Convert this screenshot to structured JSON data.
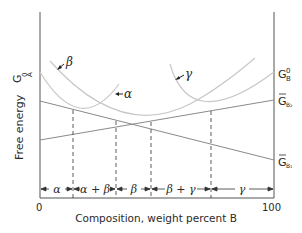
{
  "diagram": {
    "type": "free-energy-composition",
    "y_axis_label": "Free energy",
    "x_axis_label": "Composition, weight percent B",
    "x_ticks": [
      "0",
      "100"
    ],
    "left_labels": {
      "GA0": "G",
      "GA0_sub": "A",
      "GA0_sup": "0"
    },
    "right_labels": {
      "GB0": "G",
      "GB0_sub": "B",
      "GB0_sup": "0",
      "GB2": "G",
      "GB2_sub": "B₂",
      "GB1": "G",
      "GB1_sub": "B₁"
    },
    "curve_labels": {
      "beta": "β",
      "alpha": "α",
      "gamma": "γ"
    },
    "phase_regions": [
      "α",
      "α + β",
      "β",
      "β + γ",
      "γ"
    ],
    "colors": {
      "axis": "#555555",
      "curve": "#c8c8c8",
      "tangent": "#8a8a8a",
      "text": "#2a2a2a"
    }
  }
}
